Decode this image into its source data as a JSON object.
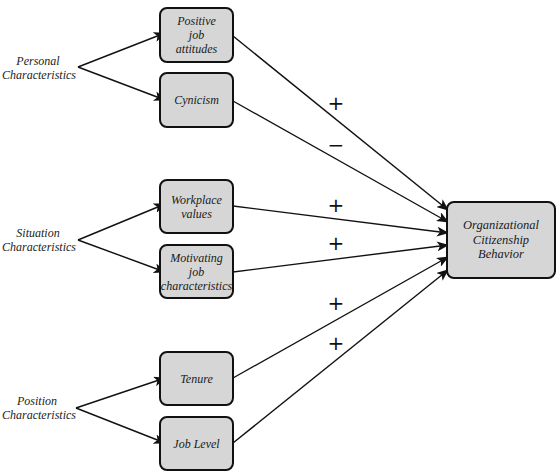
{
  "diagram": {
    "groups": [
      {
        "id": "personal",
        "label_line1": "Personal",
        "label_line2": "Characteristics"
      },
      {
        "id": "situation",
        "label_line1": "Situation",
        "label_line2": "Characteristics"
      },
      {
        "id": "position",
        "label_line1": "Position",
        "label_line2": "Characteristics"
      }
    ],
    "nodes": [
      {
        "id": "positive-job-attitudes",
        "line1": "Positive",
        "line2": "job",
        "line3": "attitudes",
        "group": "personal",
        "sign": "+"
      },
      {
        "id": "cynicism",
        "line1": "Cynicism",
        "group": "personal",
        "sign": "−"
      },
      {
        "id": "workplace-values",
        "line1": "Workplace",
        "line2": "values",
        "group": "situation",
        "sign": "+"
      },
      {
        "id": "motivating-job-characteristics",
        "line1": "Motivating",
        "line2": "job",
        "line3": "characteristics",
        "group": "situation",
        "sign": "+"
      },
      {
        "id": "tenure",
        "line1": "Tenure",
        "group": "position",
        "sign": "+"
      },
      {
        "id": "job-level",
        "line1": "Job Level",
        "group": "position",
        "sign": "+"
      }
    ],
    "outcome": {
      "line1": "Organizational",
      "line2": "Citizenship",
      "line3": "Behavior"
    },
    "signs": [
      "+",
      "−",
      "+",
      "+",
      "+",
      "+"
    ],
    "colors": {
      "box_fill": "#d6d6d6",
      "stroke": "#111111",
      "background": "#ffffff"
    }
  }
}
